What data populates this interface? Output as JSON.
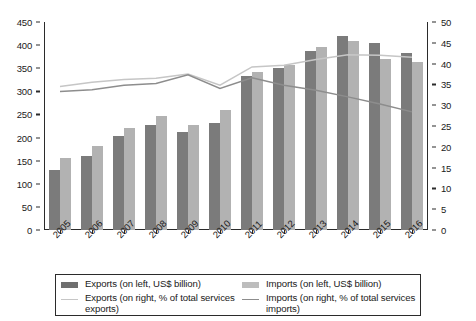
{
  "chart_data": {
    "type": "bar",
    "title": "",
    "subtitle": "",
    "xlabel": "",
    "ylabel": "",
    "categories": [
      "2005",
      "2006",
      "2007",
      "2008",
      "2009",
      "2010",
      "2011",
      "2012",
      "2013",
      "2014",
      "2015",
      "2016"
    ],
    "left_axis": {
      "label": "US$ billion",
      "ylim": [
        0,
        450
      ],
      "ticks": [
        0,
        50,
        100,
        150,
        200,
        250,
        300,
        350,
        400,
        450
      ],
      "tick_labels": [
        "0",
        "50",
        "100",
        "150",
        "200",
        "250",
        "300",
        "350",
        "400",
        "450"
      ]
    },
    "right_axis": {
      "label": "% of total services",
      "ylim": [
        0,
        50
      ],
      "ticks": [
        0,
        5,
        10,
        15,
        20,
        25,
        30,
        35,
        40,
        45,
        50
      ],
      "tick_labels": [
        "0",
        "5",
        "10",
        "15",
        "20",
        "25",
        "30",
        "35",
        "40",
        "45",
        "50"
      ]
    },
    "grid": false,
    "legend_position": "bottom",
    "series": [
      {
        "name": "Exports (on left, US$ billion)",
        "type": "bar",
        "axis": "left",
        "color": "#7b7b7b",
        "values": [
          129,
          161,
          203,
          228,
          211,
          232,
          333,
          350,
          388,
          420,
          404,
          384
        ]
      },
      {
        "name": "Imports (on left, US$ billion)",
        "type": "bar",
        "axis": "left",
        "color": "#b2b2b2",
        "values": [
          155,
          182,
          221,
          247,
          227,
          259,
          341,
          357,
          397,
          410,
          370,
          364
        ]
      },
      {
        "name": "Exports (on right, % of total services exports)",
        "type": "line",
        "axis": "right",
        "color": "#c6c6c6",
        "values": [
          34.5,
          35.5,
          36.2,
          36.5,
          37.5,
          34.8,
          39.2,
          39.6,
          41.0,
          42.1,
          42.0,
          41.5
        ]
      },
      {
        "name": "Imports (on right, % of total services imports)",
        "type": "line",
        "axis": "right",
        "color": "#8d8d8d",
        "values": [
          33.3,
          33.7,
          34.8,
          35.2,
          37.3,
          34.0,
          36.6,
          34.8,
          33.6,
          32.0,
          30.3,
          28.4
        ]
      }
    ]
  },
  "legend": {
    "entries": [
      {
        "label": "Exports (on left, US$ billion)",
        "swatch": "bar-dark"
      },
      {
        "label": "Exports (on right, % of total services exports)",
        "swatch": "line-light"
      },
      {
        "label": "Imports (on left, US$ billion)",
        "swatch": "bar-light"
      },
      {
        "label": "Imports (on right, % of total services imports)",
        "swatch": "line-dark"
      }
    ]
  },
  "colors": {
    "bar_exports": "#7b7b7b",
    "bar_imports": "#b2b2b2",
    "line_exports": "#c6c6c6",
    "line_imports": "#8d8d8d",
    "axis": "#2b2b2b",
    "background": "#ffffff"
  }
}
